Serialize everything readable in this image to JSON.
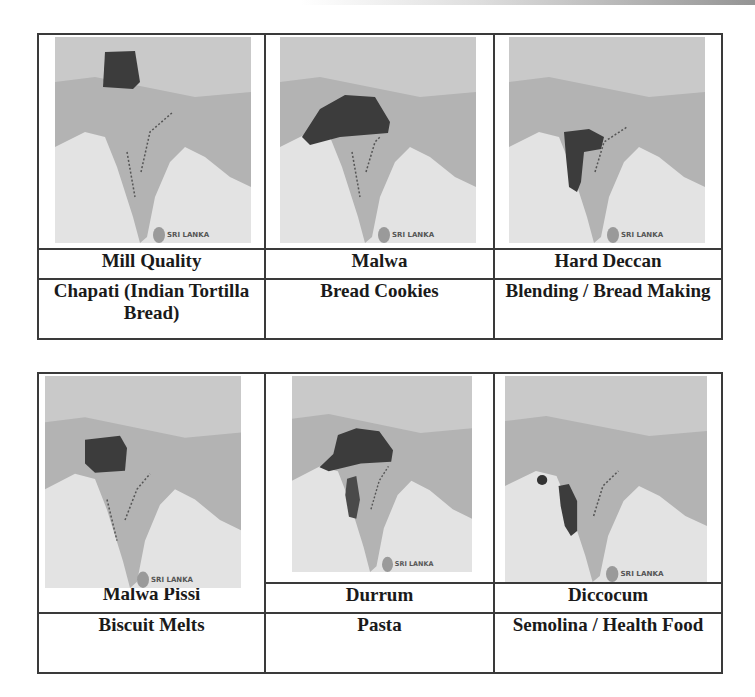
{
  "tables": [
    {
      "cells": [
        {
          "variety": "Mill Quality",
          "use": "Chapati (Indian Tortilla Bread)",
          "map": {
            "region": "northwest-punjab",
            "label": "SRI LANKA"
          }
        },
        {
          "variety": "Malwa",
          "use": "Bread Cookies",
          "map": {
            "region": "central-malwa-plateau",
            "label": "SRI LANKA"
          }
        },
        {
          "variety": "Hard Deccan",
          "use": "Blending / Bread Making",
          "map": {
            "region": "deccan-west",
            "label": "SRI LANKA"
          }
        }
      ]
    },
    {
      "cells": [
        {
          "variety": "Malwa Pissi",
          "use": "Biscuit Melts",
          "map": {
            "region": "madhya-pradesh-west",
            "label": "SRI LANKA"
          }
        },
        {
          "variety": "Durrum",
          "use": "Pasta",
          "map": {
            "region": "central-plus-deccan-strip",
            "label": "SRI LANKA"
          }
        },
        {
          "variety": "Diccocum",
          "use": "Semolina / Health Food",
          "map": {
            "region": "western-ghats-strip",
            "label": "SRI LANKA"
          }
        }
      ]
    }
  ],
  "colors": {
    "border": "#3a3a3a",
    "text": "#1a1a1a",
    "land": "#b3b3b3",
    "sea": "#e3e3e3",
    "highlight": "#3c3c3c"
  }
}
